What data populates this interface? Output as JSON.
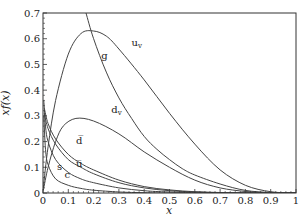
{
  "chart_data": {
    "type": "line",
    "title": "",
    "xlabel": "x",
    "ylabel": "xf(x)",
    "xlim": [
      0,
      1
    ],
    "ylim": [
      0,
      0.7
    ],
    "grid": false,
    "legend": "inline curve labels",
    "x_ticks": [
      "0",
      "0.1",
      "0.2",
      "0.3",
      "0.4",
      "0.5",
      "0.6",
      "0.7",
      "0.8",
      "0.9",
      "1"
    ],
    "y_ticks": [
      "0",
      "0.1",
      "0.2",
      "0.3",
      "0.4",
      "0.5",
      "0.6",
      "0.7"
    ],
    "series": [
      {
        "name": "u_v",
        "label": "u",
        "sub": "v",
        "x": [
          0.001,
          0.02,
          0.05,
          0.1,
          0.15,
          0.2,
          0.25,
          0.3,
          0.4,
          0.5,
          0.6,
          0.7,
          0.8,
          0.9,
          1.0
        ],
        "y": [
          0.02,
          0.18,
          0.36,
          0.54,
          0.62,
          0.63,
          0.61,
          0.56,
          0.44,
          0.31,
          0.19,
          0.09,
          0.03,
          0.005,
          0.0
        ]
      },
      {
        "name": "d_v",
        "label": "d",
        "sub": "v",
        "x": [
          0.001,
          0.02,
          0.05,
          0.08,
          0.13,
          0.2,
          0.3,
          0.4,
          0.5,
          0.6,
          0.7,
          0.8,
          0.9,
          1.0
        ],
        "y": [
          0.01,
          0.1,
          0.2,
          0.26,
          0.29,
          0.28,
          0.23,
          0.16,
          0.1,
          0.05,
          0.02,
          0.006,
          0.001,
          0.0
        ]
      },
      {
        "name": "g",
        "label": "g",
        "x": [
          0.17,
          0.2,
          0.25,
          0.3,
          0.35,
          0.4,
          0.45,
          0.5,
          0.55,
          0.6,
          0.7,
          0.8,
          0.9,
          1.0
        ],
        "y": [
          0.7,
          0.6,
          0.47,
          0.37,
          0.29,
          0.22,
          0.17,
          0.13,
          0.095,
          0.07,
          0.035,
          0.01,
          0.002,
          0.0
        ]
      },
      {
        "name": "dbar",
        "label": "d̅",
        "x": [
          0.005,
          0.02,
          0.05,
          0.1,
          0.15,
          0.2,
          0.3,
          0.4,
          0.5,
          0.6,
          0.7,
          0.8,
          1.0
        ],
        "y": [
          0.33,
          0.27,
          0.21,
          0.15,
          0.115,
          0.09,
          0.05,
          0.025,
          0.012,
          0.005,
          0.002,
          0.0,
          0.0
        ]
      },
      {
        "name": "ubar",
        "label": "u̅",
        "x": [
          0.005,
          0.02,
          0.05,
          0.1,
          0.15,
          0.2,
          0.3,
          0.4,
          0.5,
          0.6,
          0.7,
          0.8,
          1.0
        ],
        "y": [
          0.31,
          0.25,
          0.19,
          0.13,
          0.1,
          0.075,
          0.04,
          0.02,
          0.009,
          0.004,
          0.001,
          0.0,
          0.0
        ]
      },
      {
        "name": "s",
        "label": "s",
        "x": [
          0.003,
          0.01,
          0.02,
          0.05,
          0.1,
          0.15,
          0.2,
          0.3,
          0.4,
          0.5,
          0.7,
          1.0
        ],
        "y": [
          0.36,
          0.26,
          0.2,
          0.13,
          0.08,
          0.055,
          0.04,
          0.02,
          0.009,
          0.004,
          0.0,
          0.0
        ]
      },
      {
        "name": "c",
        "label": "c",
        "x": [
          0.003,
          0.01,
          0.02,
          0.05,
          0.1,
          0.15,
          0.2,
          0.3,
          0.4,
          0.5,
          0.7,
          1.0
        ],
        "y": [
          0.3,
          0.17,
          0.11,
          0.055,
          0.03,
          0.018,
          0.011,
          0.004,
          0.001,
          0.0,
          0.0,
          0.0
        ]
      }
    ],
    "annotations": [
      {
        "text": "u",
        "sub": "v",
        "x": 0.35,
        "y": 0.57
      },
      {
        "text": "g",
        "x": 0.23,
        "y": 0.52
      },
      {
        "text": "d",
        "sub": "v",
        "x": 0.27,
        "y": 0.31
      },
      {
        "text": "d̅",
        "x": 0.13,
        "y": 0.19
      },
      {
        "text": "u̅",
        "x": 0.13,
        "y": 0.1
      },
      {
        "text": "s",
        "x": 0.055,
        "y": 0.09
      },
      {
        "text": "c",
        "x": 0.085,
        "y": 0.06
      }
    ]
  }
}
